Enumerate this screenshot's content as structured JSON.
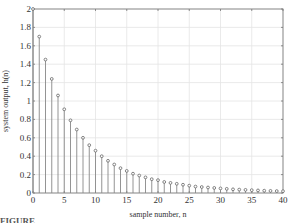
{
  "chart_data": {
    "type": "stem",
    "title": "",
    "xlabel": "sample number, n",
    "ylabel": "system output, h(n)",
    "xlim": [
      0,
      40
    ],
    "ylim": [
      0,
      2
    ],
    "grid": true,
    "x_ticks": [
      0,
      5,
      10,
      15,
      20,
      25,
      30,
      35,
      40
    ],
    "y_ticks": [
      0,
      0.2,
      0.4,
      0.6,
      0.8,
      1,
      1.2,
      1.4,
      1.6,
      1.8,
      2
    ],
    "x": [
      0,
      1,
      2,
      3,
      4,
      5,
      6,
      7,
      8,
      9,
      10,
      11,
      12,
      13,
      14,
      15,
      16,
      17,
      18,
      19,
      20,
      21,
      22,
      23,
      24,
      25,
      26,
      27,
      28,
      29,
      30,
      31,
      32,
      33,
      34,
      35,
      36,
      37,
      38,
      39,
      40
    ],
    "values": [
      2.0,
      1.7,
      1.45,
      1.24,
      1.06,
      0.91,
      0.79,
      0.69,
      0.6,
      0.52,
      0.46,
      0.4,
      0.35,
      0.31,
      0.27,
      0.24,
      0.21,
      0.19,
      0.17,
      0.15,
      0.14,
      0.12,
      0.11,
      0.1,
      0.09,
      0.08,
      0.07,
      0.065,
      0.06,
      0.055,
      0.05,
      0.045,
      0.04,
      0.037,
      0.034,
      0.031,
      0.028,
      0.025,
      0.023,
      0.021,
      0.02
    ]
  },
  "caption": "FIGURE"
}
